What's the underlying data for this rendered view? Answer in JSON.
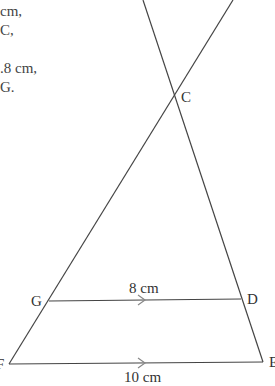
{
  "problem_text": {
    "lines": [
      "cm,",
      "C,",
      "",
      ".8 cm,",
      "G."
    ]
  },
  "diagram": {
    "points": {
      "C": {
        "label": "C",
        "x": 174,
        "y": 96
      },
      "G": {
        "label": "G",
        "x": 49,
        "y": 301
      },
      "D": {
        "label": "D",
        "x": 241,
        "y": 299
      },
      "F": {
        "label": "F",
        "x": 9,
        "y": 364
      },
      "E": {
        "label": "E",
        "x": 263,
        "y": 362
      }
    },
    "segments": {
      "GD": {
        "label": "8 cm",
        "parallel_marker": true
      },
      "FE": {
        "label": "10 cm",
        "parallel_marker": true
      }
    },
    "line_color": "#444444"
  }
}
